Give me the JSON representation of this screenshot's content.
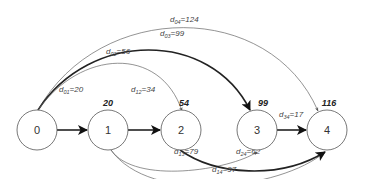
{
  "nodes": [
    {
      "id": "0",
      "label": "0",
      "dist": ""
    },
    {
      "id": "1",
      "label": "1",
      "dist": "20"
    },
    {
      "id": "2",
      "label": "2",
      "dist": "54"
    },
    {
      "id": "3",
      "label": "3",
      "dist": "99"
    },
    {
      "id": "4",
      "label": "4",
      "dist": "116"
    }
  ],
  "edges": [
    {
      "from": "0",
      "to": "1",
      "var": "d",
      "sub": "01",
      "value": "=20",
      "bold": true
    },
    {
      "from": "1",
      "to": "2",
      "var": "d",
      "sub": "12",
      "value": "=34",
      "bold": true
    },
    {
      "from": "0",
      "to": "2",
      "var": "d",
      "sub": "02",
      "value": "=56",
      "bold": false
    },
    {
      "from": "0",
      "to": "3",
      "var": "d",
      "sub": "03",
      "value": "=99",
      "bold": true
    },
    {
      "from": "0",
      "to": "4",
      "var": "d",
      "sub": "04",
      "value": "=124",
      "bold": false
    },
    {
      "from": "3",
      "to": "4",
      "var": "d",
      "sub": "34",
      "value": "=17",
      "bold": true
    },
    {
      "from": "1",
      "to": "3",
      "var": "d",
      "sub": "13",
      "value": "=79",
      "bold": false
    },
    {
      "from": "2",
      "to": "4",
      "var": "d",
      "sub": "24",
      "value": "=62",
      "bold": true
    },
    {
      "from": "1",
      "to": "4",
      "var": "d",
      "sub": "14",
      "value": "=97",
      "bold": false
    }
  ]
}
